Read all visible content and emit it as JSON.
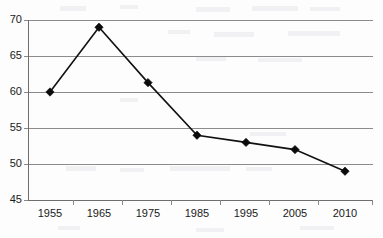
{
  "chart_data": {
    "type": "line",
    "title": "",
    "subtitle": "",
    "xlabel": "",
    "ylabel": "",
    "categories": [
      "1955",
      "1965",
      "1975",
      "1985",
      "1995",
      "2005",
      "2010"
    ],
    "values": [
      60,
      69,
      61.3,
      54,
      53,
      52,
      49
    ],
    "series": [
      {
        "name": "",
        "values": [
          60,
          69,
          61.3,
          54,
          53,
          52,
          49
        ]
      }
    ],
    "ylim": [
      45,
      70
    ],
    "yticks": [
      45,
      50,
      55,
      60,
      65,
      70
    ],
    "ytick_labels": [
      "45",
      "50",
      "55",
      "60",
      "65",
      "70"
    ],
    "xtick_labels": [
      "1955",
      "1965",
      "1975",
      "1985",
      "1995",
      "2005",
      "2010"
    ],
    "grid": true,
    "grid_axis": "y",
    "legend": false,
    "legend_position": "none",
    "marker": "diamond",
    "line_color": "#111111",
    "marker_color": "#0b0b0b",
    "grid_color": "#8c8c8c",
    "axis_color": "#6e6e6e",
    "background_color": "#fdfdfd",
    "annotations": []
  }
}
